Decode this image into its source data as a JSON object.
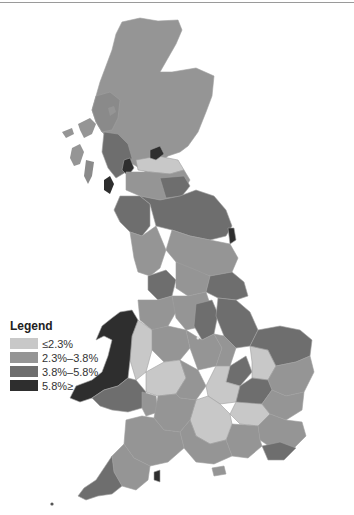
{
  "map": {
    "title": "",
    "subject": "Great Britain regional choropleth",
    "colors": {
      "c1": "#c8c8c8",
      "c2": "#959595",
      "c3": "#6e6e6e",
      "c4": "#2e2e2e",
      "background": "#ffffff",
      "border": "#b0b0b0"
    }
  },
  "legend": {
    "title": "Legend",
    "items": [
      {
        "label": "≤2.3%",
        "color": "#c8c8c8"
      },
      {
        "label": "2.3%–3.8%",
        "color": "#959595"
      },
      {
        "label": "3.8%–5.8%",
        "color": "#6e6e6e"
      },
      {
        "label": "5.8%≥",
        "color": "#2e2e2e"
      }
    ]
  }
}
